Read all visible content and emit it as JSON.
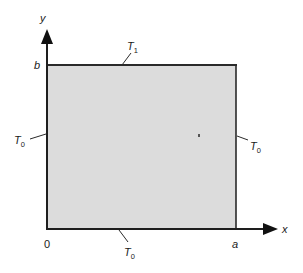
{
  "diagram": {
    "type": "rectangular-plate-boundary-conditions",
    "colors": {
      "plate_fill": "#dcdcdc",
      "line": "#2a2a2a",
      "text": "#1a1a1a",
      "background": "#ffffff"
    },
    "axes": {
      "x_label": "x",
      "y_label": "y",
      "origin_label": "0",
      "x_extent_label": "a",
      "y_extent_label": "b"
    },
    "boundaries": {
      "top": {
        "symbol": "T",
        "subscript": "1"
      },
      "left": {
        "symbol": "T",
        "subscript": "0"
      },
      "right": {
        "symbol": "T",
        "subscript": "0"
      },
      "bottom": {
        "symbol": "T",
        "subscript": "0"
      }
    }
  }
}
